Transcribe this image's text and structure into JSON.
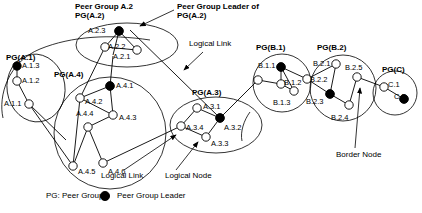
{
  "diagram": {
    "annotations": [
      {
        "id": "peer-group-a2",
        "text": "Peer Group A.2",
        "x": 75,
        "y": 4,
        "bold": true
      },
      {
        "id": "pg-a2-sub",
        "text": "PG(A.2)",
        "x": 75,
        "y": 12,
        "bold": true
      },
      {
        "id": "pg-leader-of",
        "text": "Peer Group Leader of",
        "x": 177,
        "y": 4,
        "bold": true
      },
      {
        "id": "pg-leader-of-sub",
        "text": "PG(A.2)",
        "x": 177,
        "y": 12,
        "bold": true
      },
      {
        "id": "logical-link-top",
        "text": "Logical Link",
        "x": 189,
        "y": 41,
        "bold": false
      },
      {
        "id": "logical-link-bottom",
        "text": "Logical Link",
        "x": 101,
        "y": 173,
        "bold": false
      },
      {
        "id": "logical-node",
        "text": "Logical Node",
        "x": 165,
        "y": 173,
        "bold": false
      },
      {
        "id": "border-node",
        "text": "Border Node",
        "x": 338,
        "y": 152,
        "bold": false
      }
    ],
    "group_labels": [
      {
        "id": "pg-a1",
        "text": "PG(A.1)",
        "x": 6,
        "y": 55
      },
      {
        "id": "pg-a4",
        "text": "PG(A.4)",
        "x": 54,
        "y": 72
      },
      {
        "id": "pg-a3",
        "text": "PG(A.3)",
        "x": 192,
        "y": 90
      },
      {
        "id": "pg-b1",
        "text": "PG(B.1)",
        "x": 256,
        "y": 45
      },
      {
        "id": "pg-b2",
        "text": "PG(B.2)",
        "x": 317,
        "y": 45
      },
      {
        "id": "pg-c",
        "text": "PG(C)",
        "x": 382,
        "y": 67
      }
    ],
    "peer_groups": [
      {
        "id": "A.1",
        "label": "PG(A.1)",
        "nodes": [
          {
            "id": "A.1.3",
            "label": "A.1.3",
            "leader": true
          },
          {
            "id": "A.1.2",
            "label": "A.1.2",
            "leader": false
          },
          {
            "id": "A.1.1",
            "label": "A.1.1",
            "leader": false
          }
        ]
      },
      {
        "id": "A.2",
        "label": "PG(A.2)",
        "nodes": [
          {
            "id": "A.2.3",
            "label": "A.2.3",
            "leader": true
          },
          {
            "id": "A.2.2",
            "label": "A.2.2",
            "leader": false
          },
          {
            "id": "A.2.1",
            "label": "A.2.1",
            "leader": false
          }
        ]
      },
      {
        "id": "A.3",
        "label": "PG(A.3)",
        "nodes": [
          {
            "id": "A.3.1",
            "label": "A.3.1",
            "leader": false
          },
          {
            "id": "A.3.2",
            "label": "A.3.2",
            "leader": true
          },
          {
            "id": "A.3.3",
            "label": "A.3.3",
            "leader": false
          },
          {
            "id": "A.3.4",
            "label": "A.3.4",
            "leader": false
          }
        ]
      },
      {
        "id": "A.4",
        "label": "PG(A.4)",
        "nodes": [
          {
            "id": "A.4.1",
            "label": "A.4.1",
            "leader": true
          },
          {
            "id": "A.4.2",
            "label": "A.4.2",
            "leader": false
          },
          {
            "id": "A.4.3",
            "label": "A.4.3",
            "leader": false
          },
          {
            "id": "A.4.4",
            "label": "A.4.4",
            "leader": false
          },
          {
            "id": "A.4.5",
            "label": "A.4.5",
            "leader": false
          },
          {
            "id": "A.4.6",
            "label": "A.4.6",
            "leader": false
          }
        ]
      },
      {
        "id": "B.1",
        "label": "PG(B.1)",
        "nodes": [
          {
            "id": "B.1.1",
            "label": "B.1.1",
            "leader": true
          },
          {
            "id": "B.1.2",
            "label": "B.1.2",
            "leader": false
          },
          {
            "id": "B.1.3",
            "label": "B.1.3",
            "leader": false
          }
        ]
      },
      {
        "id": "B.2",
        "label": "PG(B.2)",
        "nodes": [
          {
            "id": "B.2.1",
            "label": "B.2.1",
            "leader": false
          },
          {
            "id": "B.2.2",
            "label": "B.2.2",
            "leader": false
          },
          {
            "id": "B.2.3",
            "label": "B.2.3",
            "leader": true
          },
          {
            "id": "B.2.4",
            "label": "B.2.4",
            "leader": false
          },
          {
            "id": "B.2.5",
            "label": "B.2.5",
            "leader": false
          }
        ]
      },
      {
        "id": "C",
        "label": "PG(C)",
        "nodes": [
          {
            "id": "C.1",
            "label": "C.1",
            "leader": false
          },
          {
            "id": "C.2",
            "label": "C.2",
            "leader": true
          }
        ]
      }
    ],
    "node_labels": [
      {
        "id": "A.1.3",
        "text": "A.1.3",
        "x": 19,
        "y": 65
      },
      {
        "id": "A.1.2",
        "text": "A.1.2",
        "x": 19,
        "y": 80
      },
      {
        "id": "A.1.1",
        "text": "A.1.1",
        "x": 2,
        "y": 106
      },
      {
        "id": "A.2.3",
        "text": "A.2.3",
        "x": 87,
        "y": 28
      },
      {
        "id": "A.2.2",
        "text": "A.2.2",
        "x": 105,
        "y": 48
      },
      {
        "id": "A.2.1",
        "text": "A.2.1",
        "x": 110,
        "y": 58
      },
      {
        "id": "A.4.1",
        "text": "A.4.1",
        "x": 112,
        "y": 88
      },
      {
        "id": "A.4.2",
        "text": "A.4.2",
        "x": 87,
        "y": 102
      },
      {
        "id": "A.4.3",
        "text": "A.4.3",
        "x": 118,
        "y": 117
      },
      {
        "id": "A.4.4",
        "text": "A.4.4",
        "x": 78,
        "y": 113
      },
      {
        "id": "A.4.5",
        "text": "A.4.5",
        "x": 78,
        "y": 172
      },
      {
        "id": "A.4.6",
        "text": "A.4.6",
        "x": 108,
        "y": 172
      },
      {
        "id": "A.3.1",
        "text": "A.3.1",
        "x": 201,
        "y": 106
      },
      {
        "id": "A.3.2",
        "text": "A.3.2",
        "x": 224,
        "y": 128
      },
      {
        "id": "A.3.3",
        "text": "A.3.3",
        "x": 212,
        "y": 144
      },
      {
        "id": "A.3.4",
        "text": "A.3.4",
        "x": 188,
        "y": 128
      },
      {
        "id": "B.1.1",
        "text": "B.1.1",
        "x": 254,
        "y": 66
      },
      {
        "id": "B.1.2",
        "text": "B.1.2",
        "x": 264,
        "y": 82
      },
      {
        "id": "B.1.3",
        "text": "B.1.3",
        "x": 266,
        "y": 103
      },
      {
        "id": "B.2.1",
        "text": "B.2.1",
        "x": 311,
        "y": 63
      },
      {
        "id": "B.2.2",
        "text": "B.2.2",
        "x": 310,
        "y": 80
      },
      {
        "id": "B.2.3",
        "text": "B.2.3",
        "x": 306,
        "y": 102
      },
      {
        "id": "B.2.4",
        "text": "B.2.4",
        "x": 329,
        "y": 118
      },
      {
        "id": "B.2.5",
        "text": "B.2.5",
        "x": 346,
        "y": 68
      },
      {
        "id": "C.1",
        "text": "C.1",
        "x": 390,
        "y": 85
      },
      {
        "id": "C.2",
        "text": "C.2",
        "x": 396,
        "y": 97
      }
    ],
    "legend": {
      "pg_abbrev": "PG: Peer Group",
      "leader_marker": "Peer Group Leader",
      "leader_color": "#000000",
      "node_fill": "#ffffff",
      "stroke_color": "#000000"
    }
  }
}
